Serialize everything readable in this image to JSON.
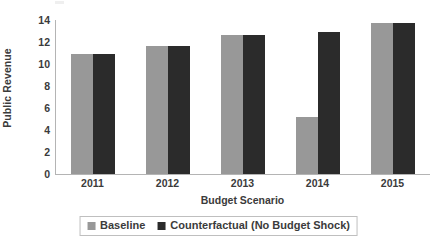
{
  "chart_data": {
    "type": "bar",
    "title": "",
    "subtitle": "",
    "xlabel": "Budget Scenario",
    "ylabel": "Public Revenue",
    "categories": [
      "2011",
      "2012",
      "2013",
      "2014",
      "2015"
    ],
    "series": [
      {
        "name": "Baseline",
        "color": "#989898",
        "values": [
          10.9,
          11.6,
          12.6,
          5.2,
          13.7
        ]
      },
      {
        "name": "Counterfactual (No Budget Shock)",
        "color": "#2b2b2b",
        "values": [
          10.9,
          11.6,
          12.6,
          12.9,
          13.7
        ]
      }
    ],
    "ylim": [
      0,
      14
    ],
    "ytick_labels": [
      "0",
      "2",
      "4",
      "6",
      "8",
      "10",
      "12",
      "14"
    ],
    "ytick_values": [
      0,
      2,
      4,
      6,
      8,
      10,
      12,
      14
    ],
    "grid": false,
    "legend_position": "bottom",
    "annotations": []
  },
  "legend": {
    "entries": [
      {
        "label": "Baseline",
        "color": "#989898"
      },
      {
        "label": "Counterfactual (No Budget Shock)",
        "color": "#2b2b2b"
      }
    ]
  },
  "colors": {
    "baseline": "#989898",
    "counterfactual": "#2b2b2b",
    "axis": "#b4b4b4",
    "text": "#3b3b3b",
    "background": "#ffffff",
    "legend_border": "#bfbfbf"
  }
}
